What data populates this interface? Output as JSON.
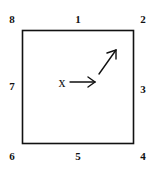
{
  "diagram": {
    "type": "square-with-neighbor-labels",
    "center_symbol": "x",
    "labels": [
      {
        "id": "n8",
        "text": "8",
        "x": 12,
        "y": 19
      },
      {
        "id": "n1",
        "text": "1",
        "x": 78,
        "y": 19
      },
      {
        "id": "n2",
        "text": "2",
        "x": 143,
        "y": 19
      },
      {
        "id": "n7",
        "text": "7",
        "x": 12,
        "y": 86
      },
      {
        "id": "n3",
        "text": "3",
        "x": 143,
        "y": 89
      },
      {
        "id": "n6",
        "text": "6",
        "x": 12,
        "y": 156
      },
      {
        "id": "n5",
        "text": "5",
        "x": 78,
        "y": 156
      },
      {
        "id": "n4",
        "text": "4",
        "x": 143,
        "y": 156
      }
    ],
    "arrows": [
      {
        "id": "arrow-right",
        "direction": "east"
      },
      {
        "id": "arrow-diagonal",
        "direction": "north-east"
      }
    ]
  }
}
